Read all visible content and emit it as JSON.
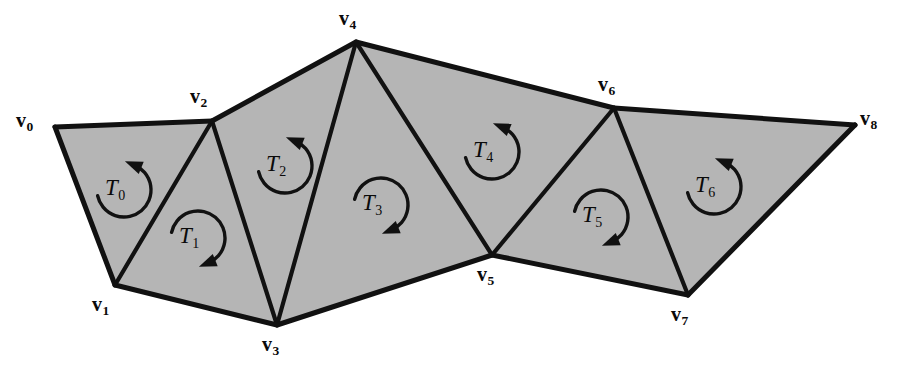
{
  "figure": {
    "width": 899,
    "height": 378,
    "background_color": "#ffffff",
    "face_fill_color": "#b5b5b5",
    "edge_color": "#111111",
    "label_color": "#0a0a0a"
  },
  "vertices": [
    {
      "id": "v0",
      "label_sym": "v",
      "label_sub": "0",
      "x": 55,
      "y": 127,
      "label_x": 16,
      "label_y": 110
    },
    {
      "id": "v1",
      "label_sym": "v",
      "label_sub": "1",
      "x": 115,
      "y": 285,
      "label_x": 92,
      "label_y": 294
    },
    {
      "id": "v2",
      "label_sym": "v",
      "label_sub": "2",
      "x": 212,
      "y": 121,
      "label_x": 190,
      "label_y": 86
    },
    {
      "id": "v3",
      "label_sym": "v",
      "label_sub": "3",
      "x": 277,
      "y": 325,
      "label_x": 262,
      "label_y": 334
    },
    {
      "id": "v4",
      "label_sym": "v",
      "label_sub": "4",
      "x": 356,
      "y": 42,
      "label_x": 339,
      "label_y": 8
    },
    {
      "id": "v5",
      "label_sym": "v",
      "label_sub": "5",
      "x": 492,
      "y": 255,
      "label_x": 477,
      "label_y": 264
    },
    {
      "id": "v6",
      "label_sym": "v",
      "label_sub": "6",
      "x": 614,
      "y": 108,
      "label_x": 598,
      "label_y": 74
    },
    {
      "id": "v7",
      "label_sym": "v",
      "label_sub": "7",
      "x": 688,
      "y": 295,
      "label_x": 671,
      "label_y": 304
    },
    {
      "id": "v8",
      "label_sym": "v",
      "label_sub": "8",
      "x": 855,
      "y": 125,
      "label_x": 860,
      "label_y": 108
    }
  ],
  "triangles": [
    {
      "id": "T0",
      "label_sym": "T",
      "label_sub": "0",
      "verts": [
        "v0",
        "v1",
        "v2"
      ],
      "orientation": "counterclockwise",
      "label_x": 105,
      "label_y": 176,
      "arc_cx": 124,
      "arc_cy": 190,
      "arc_r": 27
    },
    {
      "id": "T1",
      "label_sym": "T",
      "label_sub": "1",
      "verts": [
        "v1",
        "v3",
        "v2"
      ],
      "orientation": "clockwise",
      "label_x": 179,
      "label_y": 224,
      "arc_cx": 198,
      "arc_cy": 238,
      "arc_r": 27
    },
    {
      "id": "T2",
      "label_sym": "T",
      "label_sub": "2",
      "verts": [
        "v2",
        "v3",
        "v4"
      ],
      "orientation": "counterclockwise",
      "label_x": 266,
      "label_y": 152,
      "arc_cx": 285,
      "arc_cy": 166,
      "arc_r": 27
    },
    {
      "id": "T3",
      "label_sym": "T",
      "label_sub": "3",
      "verts": [
        "v3",
        "v5",
        "v4"
      ],
      "orientation": "clockwise",
      "label_x": 362,
      "label_y": 191,
      "arc_cx": 381,
      "arc_cy": 205,
      "arc_r": 27
    },
    {
      "id": "T4",
      "label_sym": "T",
      "label_sub": "4",
      "verts": [
        "v4",
        "v5",
        "v6"
      ],
      "orientation": "counterclockwise",
      "label_x": 473,
      "label_y": 138,
      "arc_cx": 492,
      "arc_cy": 152,
      "arc_r": 27
    },
    {
      "id": "T5",
      "label_sym": "T",
      "label_sub": "5",
      "verts": [
        "v5",
        "v7",
        "v6"
      ],
      "orientation": "clockwise",
      "label_x": 582,
      "label_y": 203,
      "arc_cx": 601,
      "arc_cy": 217,
      "arc_r": 27
    },
    {
      "id": "T6",
      "label_sym": "T",
      "label_sub": "6",
      "verts": [
        "v6",
        "v7",
        "v8"
      ],
      "orientation": "counterclockwise",
      "label_x": 695,
      "label_y": 173,
      "arc_cx": 714,
      "arc_cy": 187,
      "arc_r": 27
    }
  ],
  "edges": {
    "boundary": [
      [
        "v0",
        "v2"
      ],
      [
        "v2",
        "v4"
      ],
      [
        "v4",
        "v6"
      ],
      [
        "v6",
        "v8"
      ],
      [
        "v8",
        "v7"
      ],
      [
        "v7",
        "v5"
      ],
      [
        "v5",
        "v3"
      ],
      [
        "v3",
        "v1"
      ],
      [
        "v1",
        "v0"
      ]
    ],
    "interior": [
      [
        "v1",
        "v2"
      ],
      [
        "v2",
        "v3"
      ],
      [
        "v3",
        "v4"
      ],
      [
        "v4",
        "v5"
      ],
      [
        "v5",
        "v6"
      ],
      [
        "v6",
        "v7"
      ]
    ]
  }
}
